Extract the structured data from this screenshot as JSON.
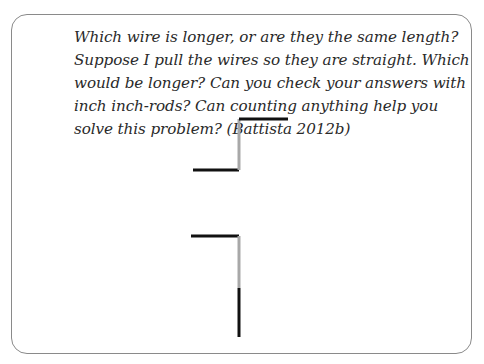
{
  "prompt": {
    "text": "Which wire is longer, or are they the same length? Suppose I pull the wires so they are straight. Which would be longer? Can you check your answers with inch inch-rods? Can counting anything help you solve this problem? (Battista 2012b)"
  },
  "figure": {
    "colors": {
      "black_segment": "#111111",
      "gray_segment": "#a8a8a8"
    },
    "wires": [
      {
        "name": "wire-1",
        "segments": [
          {
            "color": "black",
            "direction": "horizontal"
          },
          {
            "color": "gray",
            "direction": "vertical"
          },
          {
            "color": "black",
            "direction": "horizontal"
          }
        ]
      },
      {
        "name": "wire-2",
        "segments": [
          {
            "color": "black",
            "direction": "horizontal"
          },
          {
            "color": "gray",
            "direction": "vertical"
          },
          {
            "color": "black",
            "direction": "vertical"
          }
        ]
      }
    ]
  }
}
